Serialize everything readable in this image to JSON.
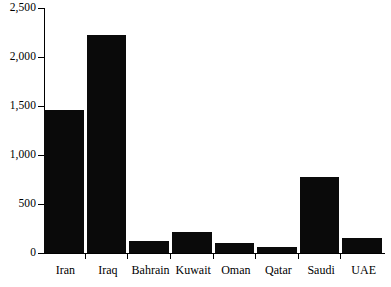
{
  "chart_data": {
    "type": "bar",
    "title": "",
    "subtitle": "",
    "xlabel": "",
    "ylabel": "",
    "categories": [
      "Iran",
      "Iraq",
      "Bahrain",
      "Kuwait",
      "Oman",
      "Qatar",
      "Saudi",
      "UAE"
    ],
    "values": [
      1460,
      2225,
      120,
      215,
      100,
      60,
      775,
      155
    ],
    "ylim": [
      0,
      2500
    ],
    "ytick_values": [
      0,
      500,
      1000,
      1500,
      2000,
      2500
    ],
    "ytick_labels": [
      "0",
      "500",
      "1,000",
      "1,500",
      "2,000",
      "2,500"
    ],
    "grid": false,
    "legend": null,
    "series": [
      {
        "name": "",
        "values": [
          1460,
          2225,
          120,
          215,
          100,
          60,
          775,
          155
        ]
      }
    ],
    "colors": {
      "bar": "#0a0a0a",
      "axis": "#000000",
      "background": "#ffffff",
      "text": "#000000"
    }
  }
}
